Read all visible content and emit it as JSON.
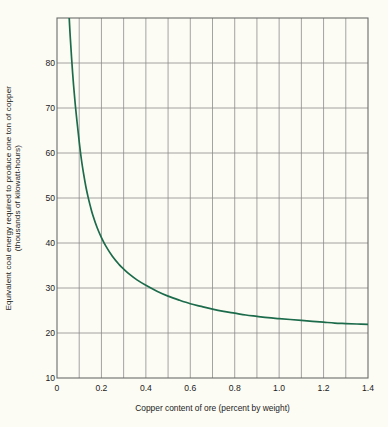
{
  "figure": {
    "background_color": "#fdfcf4",
    "curve_color": "#1c6b4b",
    "axis_color": "#6b6b6b",
    "grid_color": "#8c8c8c",
    "text_color": "#1b1b1b"
  },
  "axis_titles": {
    "y_line1": "Equivalent coal energy required to produce one ton of copper",
    "y_line2": "(thousands of kilowatt-hours)",
    "x": "Copper content of ore (percent by weight)"
  },
  "chart_data": {
    "type": "line",
    "title": "",
    "xlabel": "Copper content of ore (percent by weight)",
    "ylabel": "Equivalent coal energy required to produce one ton of copper (thousands of kilowatt-hours)",
    "xlim": [
      0,
      1.4
    ],
    "ylim": [
      0,
      80
    ],
    "grid": true,
    "legend": "none",
    "x_ticks": [
      "0",
      "0.2",
      "0.4",
      "0.6",
      "0.8",
      "1.0",
      "1.2",
      "1.4"
    ],
    "x_tick_values": [
      0,
      0.2,
      0.4,
      0.6,
      0.8,
      1.0,
      1.2,
      1.4
    ],
    "x_minor_step": 0.1,
    "y_ticks": [
      "10",
      "20",
      "30",
      "40",
      "50",
      "60",
      "70",
      "80"
    ],
    "y_tick_values": [
      10,
      20,
      30,
      40,
      50,
      60,
      70,
      80
    ],
    "series": [
      {
        "name": "Equivalent coal energy",
        "color": "#1c6b4b",
        "x": [
          0.055,
          0.06,
          0.07,
          0.08,
          0.09,
          0.1,
          0.11,
          0.12,
          0.13,
          0.14,
          0.15,
          0.16,
          0.18,
          0.2,
          0.22,
          0.25,
          0.28,
          0.3,
          0.33,
          0.36,
          0.4,
          0.45,
          0.5,
          0.55,
          0.6,
          0.65,
          0.7,
          0.75,
          0.8,
          0.85,
          0.9,
          0.95,
          1.0,
          1.05,
          1.1,
          1.15,
          1.2,
          1.25,
          1.3,
          1.35,
          1.4
        ],
        "y": [
          80.0,
          75.5,
          68.0,
          62.0,
          57.0,
          52.5,
          48.5,
          45.3,
          42.5,
          40.2,
          38.2,
          36.4,
          33.5,
          31.2,
          29.3,
          27.0,
          25.2,
          24.2,
          22.9,
          21.8,
          20.6,
          19.3,
          18.2,
          17.3,
          16.5,
          15.9,
          15.3,
          14.8,
          14.4,
          14.0,
          13.7,
          13.4,
          13.2,
          13.0,
          12.8,
          12.6,
          12.4,
          12.2,
          12.1,
          12.0,
          11.9
        ]
      }
    ],
    "annotations": []
  }
}
